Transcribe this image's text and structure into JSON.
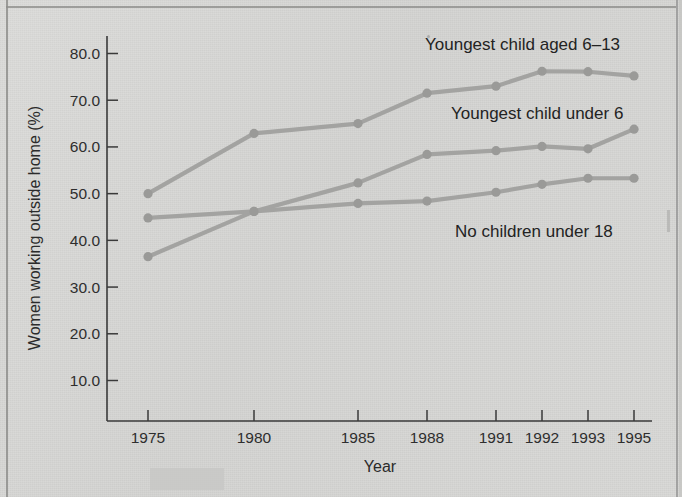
{
  "chart_data": {
    "type": "line",
    "title": "",
    "xlabel": "Year",
    "ylabel": "Women working outside home (%)",
    "categories": [
      "1975",
      "1980",
      "1985",
      "1988",
      "1991",
      "1992",
      "1993",
      "1995"
    ],
    "ylim": [
      0,
      80
    ],
    "yticks": [
      "10.0",
      "20.0",
      "30.0",
      "40.0",
      "50.0",
      "60.0",
      "70.0",
      "80.0"
    ],
    "ytick_values": [
      10,
      20,
      30,
      40,
      50,
      60,
      70,
      80
    ],
    "grid": false,
    "legend_position": "inline-annotations",
    "x_spacing": "categorical-uneven",
    "series": [
      {
        "name": "Youngest child aged 6-13",
        "label": "Youngest child aged 6–13",
        "color": "#a3a3a1",
        "values": [
          50.0,
          62.9,
          65.0,
          71.5,
          73.0,
          76.2,
          76.1,
          75.2
        ]
      },
      {
        "name": "Youngest child under 6",
        "label": "Youngest child under 6",
        "color": "#a3a3a1",
        "values": [
          36.5,
          46.2,
          52.3,
          58.4,
          59.2,
          60.1,
          59.6,
          63.8
        ]
      },
      {
        "name": "No children under 18",
        "label": "No children under 18",
        "color": "#a3a3a1",
        "values": [
          44.8,
          46.2,
          47.9,
          48.4,
          50.3,
          52.0,
          53.3,
          53.3
        ]
      }
    ],
    "annotations": [
      {
        "text": "Youngest child aged 6–13",
        "x": 425,
        "y": 50
      },
      {
        "text": "Youngest child under 6",
        "x": 451,
        "y": 119
      },
      {
        "text": "No children under 18",
        "x": 455,
        "y": 237
      }
    ]
  },
  "figure": {
    "background_color": "#d6d6d4",
    "axis_color": "#3a3a3a",
    "line_color": "#a3a3a1",
    "text_color": "#2b2b2b"
  }
}
